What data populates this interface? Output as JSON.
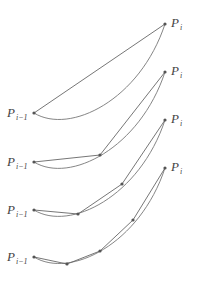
{
  "diagram": {
    "type": "curve-subdivision-approximation",
    "panels": [
      {
        "start_label": {
          "base": "P",
          "sub": "i−1"
        },
        "end_label": {
          "base": "P",
          "sub": "i"
        },
        "start": [
          34,
          113
        ],
        "end": [
          165,
          24
        ],
        "curve_ctrl": [
          [
            70,
            135
          ],
          [
            140,
            100
          ]
        ],
        "chord_points": [
          [
            34,
            113
          ],
          [
            165,
            24
          ]
        ]
      },
      {
        "start_label": {
          "base": "P",
          "sub": "i−1"
        },
        "end_label": {
          "base": "P",
          "sub": "i"
        },
        "start": [
          34,
          162
        ],
        "end": [
          165,
          72
        ],
        "curve_ctrl": [
          [
            70,
            184
          ],
          [
            140,
            148
          ]
        ],
        "chord_points": [
          [
            34,
            162
          ],
          [
            100,
            155
          ],
          [
            165,
            72
          ]
        ]
      },
      {
        "start_label": {
          "base": "P",
          "sub": "i−1"
        },
        "end_label": {
          "base": "P",
          "sub": "i"
        },
        "start": [
          34,
          210
        ],
        "end": [
          165,
          120
        ],
        "curve_ctrl": [
          [
            70,
            232
          ],
          [
            140,
            196
          ]
        ],
        "chord_points": [
          [
            34,
            210
          ],
          [
            78,
            214
          ],
          [
            122,
            184
          ],
          [
            165,
            120
          ]
        ]
      },
      {
        "start_label": {
          "base": "P",
          "sub": "i−1"
        },
        "end_label": {
          "base": "P",
          "sub": "i"
        },
        "start": [
          34,
          257
        ],
        "end": [
          165,
          168
        ],
        "curve_ctrl": [
          [
            70,
            279
          ],
          [
            140,
            244
          ]
        ],
        "chord_points": [
          [
            34,
            257
          ],
          [
            67,
            264
          ],
          [
            100,
            251
          ],
          [
            133,
            220
          ],
          [
            165,
            168
          ]
        ]
      }
    ]
  }
}
